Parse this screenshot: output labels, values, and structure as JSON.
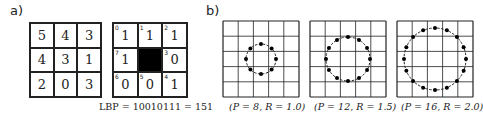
{
  "panel_a": {
    "label": "a)",
    "intensity_grid": [
      [
        "5",
        "4",
        "3"
      ],
      [
        "4",
        "3",
        "1"
      ],
      [
        "2",
        "0",
        "3"
      ]
    ],
    "binary_grid": {
      "cells": [
        {
          "index": "0",
          "value": "1"
        },
        {
          "index": "1",
          "value": "1"
        },
        {
          "index": "2",
          "value": "1"
        },
        {
          "index": "7",
          "value": "1"
        },
        {
          "index": "",
          "value": "",
          "center": true
        },
        {
          "index": "3",
          "value": "0"
        },
        {
          "index": "6",
          "value": "0"
        },
        {
          "index": "5",
          "value": "0"
        },
        {
          "index": "4",
          "value": "1"
        }
      ]
    },
    "caption": "LBP = 10010111 = 151"
  },
  "panel_b": {
    "label": "b)",
    "neighborhoods": [
      {
        "P": 8,
        "R": 1.0,
        "caption": "(P = 8, R = 1.0)",
        "radius_px": 15
      },
      {
        "P": 12,
        "R": 1.5,
        "caption": "(P = 12, R = 1.5)",
        "radius_px": 22
      },
      {
        "P": 16,
        "R": 2.0,
        "caption": "(P = 16, R = 2.0)",
        "radius_px": 31
      }
    ]
  },
  "colors": {
    "line": "#222222",
    "fill_center": "#000000",
    "background": "#ffffff"
  }
}
